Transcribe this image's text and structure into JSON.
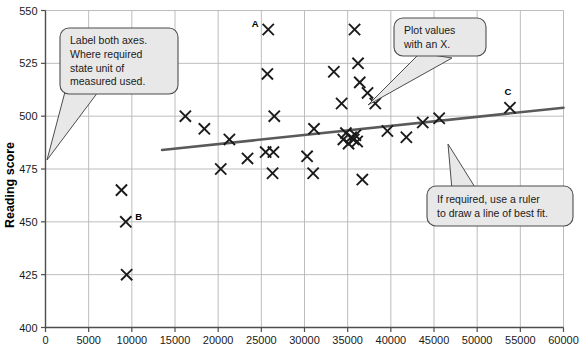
{
  "chart_data": {
    "type": "scatter",
    "title": "",
    "xlabel": "",
    "ylabel": "Reading score",
    "xlim": [
      0,
      60000
    ],
    "ylim": [
      400,
      550
    ],
    "xticks": [
      0,
      5000,
      10000,
      15000,
      20000,
      25000,
      30000,
      35000,
      40000,
      45000,
      50000,
      55000,
      60000
    ],
    "xtick_labels": [
      "0",
      "5000",
      "10000",
      "15000",
      "20000",
      "25000",
      "30000",
      "35000",
      "40000",
      "45000",
      "50000",
      "55000",
      "60000"
    ],
    "yticks": [
      400,
      425,
      450,
      475,
      500,
      525,
      550
    ],
    "ytick_labels": [
      "400",
      "425",
      "450",
      "475",
      "500",
      "525",
      "550"
    ],
    "grid": true,
    "legend": "none",
    "marker": "x",
    "marker_color": "#1a1a1a",
    "points": [
      {
        "x": 8800,
        "y": 465
      },
      {
        "x": 9300,
        "y": 450,
        "label": "B"
      },
      {
        "x": 9400,
        "y": 425
      },
      {
        "x": 16200,
        "y": 500
      },
      {
        "x": 18400,
        "y": 494
      },
      {
        "x": 20300,
        "y": 475
      },
      {
        "x": 21300,
        "y": 489
      },
      {
        "x": 23400,
        "y": 480
      },
      {
        "x": 25500,
        "y": 483
      },
      {
        "x": 26400,
        "y": 483
      },
      {
        "x": 25800,
        "y": 541,
        "label": "A"
      },
      {
        "x": 25700,
        "y": 520
      },
      {
        "x": 26300,
        "y": 473
      },
      {
        "x": 26500,
        "y": 500
      },
      {
        "x": 30300,
        "y": 481
      },
      {
        "x": 31000,
        "y": 473
      },
      {
        "x": 31100,
        "y": 494
      },
      {
        "x": 33400,
        "y": 521
      },
      {
        "x": 34300,
        "y": 506
      },
      {
        "x": 34500,
        "y": 489
      },
      {
        "x": 34800,
        "y": 492
      },
      {
        "x": 35100,
        "y": 487
      },
      {
        "x": 35400,
        "y": 490
      },
      {
        "x": 35700,
        "y": 489
      },
      {
        "x": 35900,
        "y": 491
      },
      {
        "x": 36100,
        "y": 488
      },
      {
        "x": 35800,
        "y": 541
      },
      {
        "x": 36200,
        "y": 525
      },
      {
        "x": 36400,
        "y": 516
      },
      {
        "x": 36700,
        "y": 470
      },
      {
        "x": 37300,
        "y": 511
      },
      {
        "x": 38200,
        "y": 506
      },
      {
        "x": 39600,
        "y": 493
      },
      {
        "x": 41800,
        "y": 490
      },
      {
        "x": 43700,
        "y": 497
      },
      {
        "x": 45600,
        "y": 499
      },
      {
        "x": 53800,
        "y": 504,
        "label": "C"
      }
    ],
    "trend_line": {
      "label": "line of best fit",
      "color": "#5a5a5a",
      "x_start": 13500,
      "y_start": 484,
      "x_end": 60000,
      "y_end": 504
    },
    "point_labels": [
      {
        "text": "A",
        "x": 25800,
        "y": 541
      },
      {
        "text": "B",
        "x": 9300,
        "y": 450
      },
      {
        "text": "C",
        "x": 53800,
        "y": 504
      }
    ]
  },
  "axes": {
    "y_title": "Reading score"
  },
  "callouts": [
    {
      "id": "callout-axes",
      "lines": [
        "Label both axes.",
        "Where required",
        "state unit of",
        "measured used."
      ]
    },
    {
      "id": "callout-plot-values",
      "lines": [
        "Plot values",
        "with an X."
      ]
    },
    {
      "id": "callout-ruler",
      "lines": [
        "If required, use a ruler",
        "to draw a line of best fit."
      ]
    }
  ],
  "colors": {
    "grid": "#b5b5b5",
    "axis": "#4d4d4d",
    "marker": "#1a1a1a",
    "trend": "#5b5b5b",
    "callout_fill": "#e8e8e8",
    "callout_stroke": "#4d4d4d"
  }
}
